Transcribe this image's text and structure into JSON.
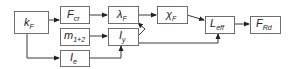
{
  "diagram": {
    "nodes": [
      {
        "id": "kF",
        "main": "k",
        "sub": "F"
      },
      {
        "id": "Fcr",
        "main": "F",
        "sub": "cr"
      },
      {
        "id": "m12",
        "main": "m",
        "sub": "1+2"
      },
      {
        "id": "Ie",
        "main": "I",
        "sub": "e"
      },
      {
        "id": "lamF",
        "main": "λ",
        "sub": "F"
      },
      {
        "id": "Iy",
        "main": "I",
        "sub": "y"
      },
      {
        "id": "chiF",
        "main": "χ",
        "sub": "F"
      },
      {
        "id": "Leff",
        "main": "L",
        "sub": "eff"
      },
      {
        "id": "FRd",
        "main": "F",
        "sub": "Rd"
      }
    ],
    "edges": [
      {
        "from": "kF",
        "to": "Fcr"
      },
      {
        "from": "kF",
        "to": "Ie"
      },
      {
        "from": "Fcr",
        "to": "lamF"
      },
      {
        "from": "m12",
        "to": "Iy"
      },
      {
        "from": "Ie",
        "to": "Iy"
      },
      {
        "from": "Iy",
        "to": "lamF"
      },
      {
        "from": "lamF",
        "to": "chiF"
      },
      {
        "from": "chiF",
        "to": "Leff"
      },
      {
        "from": "Iy",
        "to": "Leff"
      },
      {
        "from": "Leff",
        "to": "FRd"
      }
    ]
  }
}
